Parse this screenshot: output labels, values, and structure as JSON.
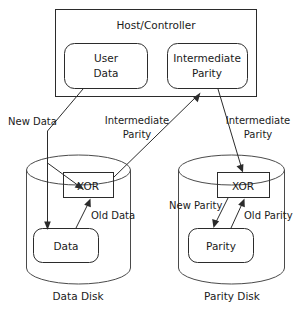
{
  "diagram": {
    "host": {
      "label": "Host/Controller",
      "boxes": [
        {
          "id": "user-data",
          "line1": "User",
          "line2": "Data"
        },
        {
          "id": "intermediate-parity",
          "line1": "Intermediate",
          "line2": "Parity"
        }
      ]
    },
    "disks": [
      {
        "id": "data-disk",
        "caption": "Data Disk",
        "xor_label": "XOR",
        "store_label": "Data"
      },
      {
        "id": "parity-disk",
        "caption": "Parity Disk",
        "xor_label": "XOR",
        "store_label": "Parity"
      }
    ],
    "flow_labels": {
      "new_data": "New Data",
      "intermediate_parity_left_line1": "Intermediate",
      "intermediate_parity_left_line2": "Parity",
      "intermediate_parity_right_line1": "Intermediate",
      "intermediate_parity_right_line2": "Parity",
      "old_data": "Old Data",
      "new_parity": "New Parity",
      "old_parity": "Old Parity"
    },
    "colors": {
      "stroke": "#2b2b2b",
      "text": "#1a1a1a",
      "background": "#ffffff"
    }
  }
}
